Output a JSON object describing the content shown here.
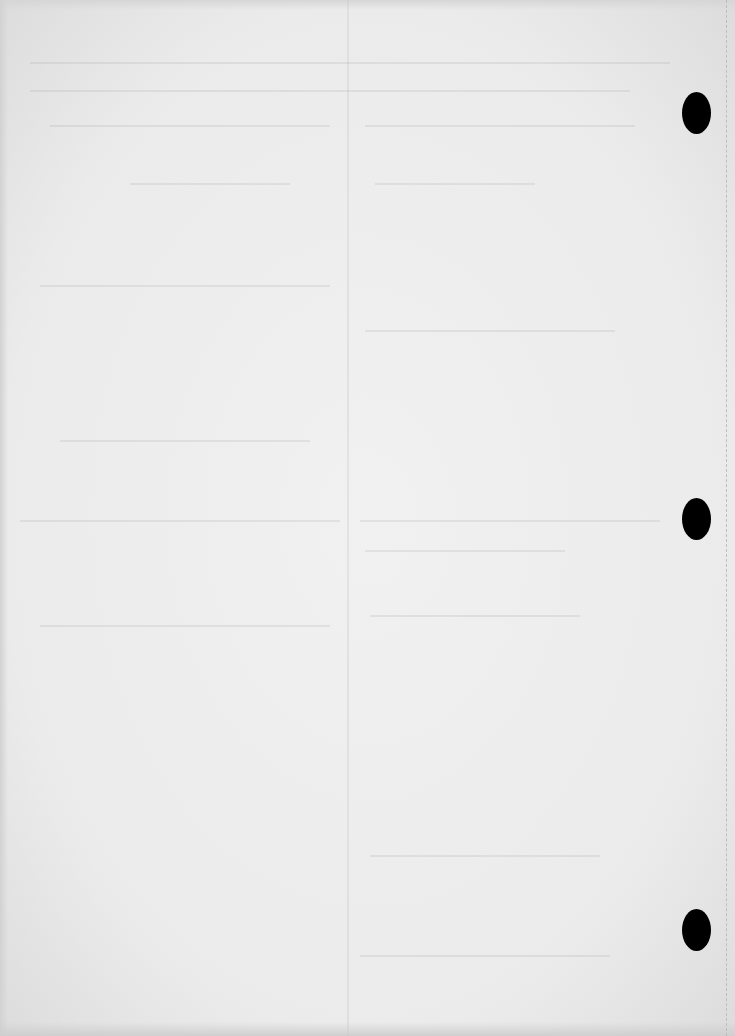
{
  "page": {
    "type": "blank scanned page (reverse side)",
    "text_content": [],
    "punch_holes": [
      {
        "x": 696,
        "y": 113
      },
      {
        "x": 696,
        "y": 519
      },
      {
        "x": 696,
        "y": 930
      }
    ],
    "colors": {
      "paper": "#ececec",
      "hole": "#000000"
    }
  }
}
